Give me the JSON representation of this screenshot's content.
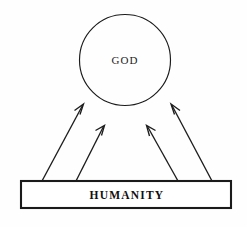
{
  "diagram": {
    "background_color": "#fefefe",
    "stroke_color": "#1a1a1a",
    "nodes": {
      "god": {
        "label": "GOD",
        "shape": "circle",
        "cx": 125,
        "cy": 60,
        "r": 45.5
      },
      "humanity": {
        "label": "HUMANITY",
        "shape": "rectangle",
        "x": 21,
        "y": 181,
        "width": 210,
        "height": 27
      }
    },
    "arrows": [
      {
        "name": "arrow-1",
        "from": "humanity",
        "to": "god",
        "x1": 42,
        "y1": 181,
        "x2": 82,
        "y2": 105
      },
      {
        "name": "arrow-2",
        "from": "humanity",
        "to": "god",
        "x1": 76,
        "y1": 181,
        "x2": 103,
        "y2": 126
      },
      {
        "name": "arrow-3",
        "from": "humanity",
        "to": "god",
        "x1": 178,
        "y1": 181,
        "x2": 148,
        "y2": 126
      },
      {
        "name": "arrow-4",
        "from": "humanity",
        "to": "god",
        "x1": 212,
        "y1": 181,
        "x2": 172,
        "y2": 105
      }
    ]
  }
}
